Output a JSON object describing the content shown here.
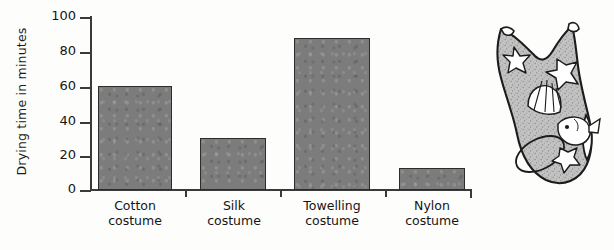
{
  "chart_data": {
    "type": "bar",
    "title": "",
    "xlabel": "",
    "ylabel": "Drying time in minutes",
    "categories": [
      "Cotton costume",
      "Silk costume",
      "Towelling costume",
      "Nylon costume"
    ],
    "category_lines": [
      [
        "Cotton",
        "costume"
      ],
      [
        "Silk",
        "costume"
      ],
      [
        "Towelling",
        "costume"
      ],
      [
        "Nylon",
        "costume"
      ]
    ],
    "values": [
      60,
      30,
      88,
      13
    ],
    "ylim": [
      0,
      100
    ],
    "yticks": [
      0,
      20,
      40,
      60,
      80,
      100
    ],
    "ytick_labels": [
      "0",
      "20",
      "40",
      "60",
      "80",
      "100"
    ],
    "grid": false,
    "legend": "none",
    "bar_color": "#7c7c7c",
    "bar_edge_color": "#2c2c2c",
    "axis_color": "#3a3a3a"
  },
  "illustration": {
    "name": "swimming-costume-drawing",
    "description": "Hand-drawn swimming costume with starfish, shell and fish motifs",
    "outline_color": "#1f1f1f",
    "fill_color": "#b9b9b9"
  }
}
